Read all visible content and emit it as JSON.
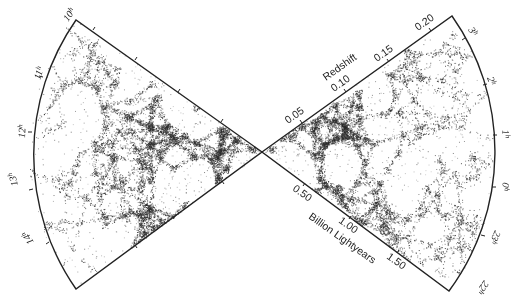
{
  "chart_data": {
    "type": "scatter",
    "subtype": "redshift-survey-cone-diagram",
    "title": "",
    "center": [
      262,
      152
    ],
    "wedges": [
      {
        "name": "left-wedge",
        "ra_labels": [
          "10h",
          "11h",
          "12h",
          "13h",
          "14h"
        ],
        "ra_range_hours": [
          10,
          14.5
        ]
      },
      {
        "name": "right-wedge",
        "ra_labels": [
          "3h",
          "2h",
          "1h",
          "0h",
          "23h",
          "22h"
        ],
        "ra_range_hours": [
          21.8,
          3.3
        ]
      }
    ],
    "redshift_axis": {
      "label": "Redshift",
      "ticks": [
        "0.05",
        "0.10",
        "0.15",
        "0.20"
      ],
      "values": [
        0.05,
        0.1,
        0.15,
        0.2
      ],
      "range": [
        0,
        0.21
      ]
    },
    "distance_axis": {
      "label": "Billion Lightyears",
      "ticks": [
        "0.50",
        "1.00",
        "1.50"
      ],
      "values": [
        0.5,
        1.0,
        1.5
      ],
      "range": [
        0,
        2.2
      ]
    },
    "points_description": "Dense filamentary point cloud of galaxies (cosmic web), densest toward center and fading outward",
    "grid": false,
    "legend": null
  },
  "labels": {
    "redshift_title": "Redshift",
    "distance_title": "Billion Lightyears",
    "z005": "0.05",
    "z010": "0.10",
    "z015": "0.15",
    "z020": "0.20",
    "d050": "0.50",
    "d100": "1.00",
    "d150": "1.50",
    "h10": "10",
    "h11": "11",
    "h12": "12",
    "h13": "13",
    "h14": "14",
    "h3": "3",
    "h2": "2",
    "h1": "1",
    "h0": "0",
    "h23": "23",
    "h22": "22",
    "h_sup": "h"
  },
  "colors": {
    "ink": "#222222",
    "points": "#2a2a2a",
    "background": "#ffffff"
  }
}
